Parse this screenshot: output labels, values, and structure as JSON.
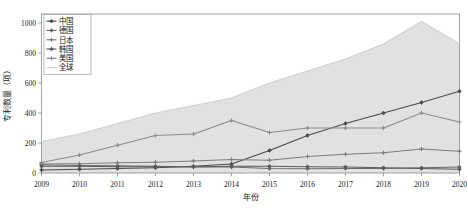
{
  "chart_data": {
    "type": "line",
    "title": "",
    "xlabel": "年份",
    "ylabel": "专利数量（项）",
    "x": [
      2009,
      2010,
      2011,
      2012,
      2013,
      2014,
      2015,
      2016,
      2017,
      2018,
      2019,
      2020
    ],
    "xtick_labels": [
      "2009",
      "2010",
      "2011",
      "2012",
      "2013",
      "2014",
      "2015",
      "2016",
      "2017",
      "2018",
      "2019",
      "2020"
    ],
    "ytick_labels": [
      "0",
      "200",
      "400",
      "600",
      "800",
      "1000"
    ],
    "yticks": [
      0,
      200,
      400,
      600,
      800,
      1000
    ],
    "ylim": [
      0,
      1060
    ],
    "xlim": [
      2009,
      2020
    ],
    "grid": false,
    "legend_position": "top-left",
    "series": [
      {
        "name": "中国",
        "color": "#4a4a4a",
        "marker": "diamond",
        "values": [
          20,
          25,
          30,
          35,
          45,
          60,
          150,
          250,
          330,
          400,
          470,
          545
        ]
      },
      {
        "name": "德国",
        "color": "#6b6b6b",
        "marker": "diamond",
        "values": [
          55,
          50,
          48,
          45,
          42,
          40,
          30,
          28,
          30,
          30,
          35,
          40
        ]
      },
      {
        "name": "日本",
        "color": "#7d7d7d",
        "marker": "plus",
        "values": [
          60,
          62,
          68,
          72,
          80,
          90,
          85,
          110,
          125,
          135,
          160,
          145
        ]
      },
      {
        "name": "韩国",
        "color": "#5a5a5a",
        "marker": "diamond",
        "values": [
          45,
          45,
          42,
          42,
          40,
          45,
          45,
          42,
          40,
          35,
          30,
          25
        ]
      },
      {
        "name": "美国",
        "color": "#8c8c8c",
        "marker": "plus",
        "values": [
          70,
          120,
          185,
          250,
          260,
          350,
          270,
          300,
          300,
          300,
          400,
          340
        ]
      },
      {
        "name": "全球",
        "color": "#cfcfcf",
        "marker": "none",
        "area": true,
        "values": [
          210,
          260,
          330,
          400,
          450,
          500,
          600,
          680,
          760,
          860,
          1010,
          860
        ]
      }
    ]
  },
  "legend": {
    "items": [
      {
        "label": "中国"
      },
      {
        "label": "德国"
      },
      {
        "label": "日本"
      },
      {
        "label": "韩国"
      },
      {
        "label": "美国"
      },
      {
        "label": "全球"
      }
    ]
  }
}
